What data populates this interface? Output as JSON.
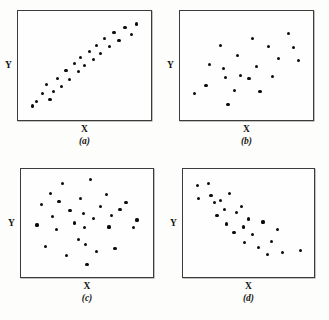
{
  "figure": {
    "background_color": "#fdfdfb",
    "frame_color": "#3b3b3b",
    "point_color": "#0b0b0b"
  },
  "labels": {
    "x": "X",
    "y": "Y",
    "caption_a": "(a)",
    "caption_b": "(b)",
    "caption_c": "(c)",
    "caption_d": "(d)"
  },
  "chart_data": [
    {
      "type": "scatter",
      "title": "(a)",
      "xlabel": "X",
      "ylabel": "Y",
      "xlim": [
        0,
        100
      ],
      "ylim": [
        0,
        100
      ],
      "grid": false,
      "legend": null,
      "annotation": "strong positive linear association",
      "points": [
        {
          "x": 8,
          "y": 9
        },
        {
          "x": 11,
          "y": 14
        },
        {
          "x": 16,
          "y": 22
        },
        {
          "x": 19,
          "y": 31
        },
        {
          "x": 22,
          "y": 16
        },
        {
          "x": 25,
          "y": 24
        },
        {
          "x": 28,
          "y": 37
        },
        {
          "x": 31,
          "y": 29
        },
        {
          "x": 35,
          "y": 45
        },
        {
          "x": 38,
          "y": 36
        },
        {
          "x": 42,
          "y": 52
        },
        {
          "x": 45,
          "y": 44
        },
        {
          "x": 47,
          "y": 58
        },
        {
          "x": 50,
          "y": 50
        },
        {
          "x": 54,
          "y": 64
        },
        {
          "x": 57,
          "y": 56
        },
        {
          "x": 60,
          "y": 70
        },
        {
          "x": 63,
          "y": 62
        },
        {
          "x": 66,
          "y": 77
        },
        {
          "x": 70,
          "y": 69
        },
        {
          "x": 74,
          "y": 83
        },
        {
          "x": 78,
          "y": 75
        },
        {
          "x": 83,
          "y": 88
        },
        {
          "x": 88,
          "y": 81
        },
        {
          "x": 92,
          "y": 92
        }
      ]
    },
    {
      "type": "scatter",
      "title": "(b)",
      "xlabel": "X",
      "ylabel": "Y",
      "xlim": [
        0,
        100
      ],
      "ylim": [
        0,
        100
      ],
      "grid": false,
      "legend": null,
      "annotation": "weak positive association with wide scatter",
      "points": [
        {
          "x": 8,
          "y": 22
        },
        {
          "x": 17,
          "y": 30
        },
        {
          "x": 20,
          "y": 51
        },
        {
          "x": 29,
          "y": 70
        },
        {
          "x": 31,
          "y": 47
        },
        {
          "x": 33,
          "y": 38
        },
        {
          "x": 35,
          "y": 11
        },
        {
          "x": 40,
          "y": 25
        },
        {
          "x": 43,
          "y": 60
        },
        {
          "x": 45,
          "y": 40
        },
        {
          "x": 52,
          "y": 37
        },
        {
          "x": 55,
          "y": 77
        },
        {
          "x": 58,
          "y": 49
        },
        {
          "x": 61,
          "y": 24
        },
        {
          "x": 68,
          "y": 69
        },
        {
          "x": 71,
          "y": 39
        },
        {
          "x": 76,
          "y": 57
        },
        {
          "x": 84,
          "y": 82
        },
        {
          "x": 88,
          "y": 68
        },
        {
          "x": 92,
          "y": 55
        }
      ]
    },
    {
      "type": "scatter",
      "title": "(c)",
      "xlabel": "X",
      "ylabel": "Y",
      "xlim": [
        0,
        100
      ],
      "ylim": [
        0,
        100
      ],
      "grid": false,
      "legend": null,
      "annotation": "no association, random cloud",
      "points": [
        {
          "x": 9,
          "y": 48
        },
        {
          "x": 13,
          "y": 69
        },
        {
          "x": 16,
          "y": 26
        },
        {
          "x": 20,
          "y": 80
        },
        {
          "x": 22,
          "y": 57
        },
        {
          "x": 25,
          "y": 43
        },
        {
          "x": 27,
          "y": 72
        },
        {
          "x": 30,
          "y": 90
        },
        {
          "x": 33,
          "y": 17
        },
        {
          "x": 36,
          "y": 63
        },
        {
          "x": 40,
          "y": 50
        },
        {
          "x": 43,
          "y": 33
        },
        {
          "x": 45,
          "y": 75
        },
        {
          "x": 47,
          "y": 60
        },
        {
          "x": 48,
          "y": 45
        },
        {
          "x": 49,
          "y": 28
        },
        {
          "x": 50,
          "y": 8
        },
        {
          "x": 53,
          "y": 94
        },
        {
          "x": 55,
          "y": 55
        },
        {
          "x": 58,
          "y": 21
        },
        {
          "x": 61,
          "y": 67
        },
        {
          "x": 66,
          "y": 79
        },
        {
          "x": 68,
          "y": 46
        },
        {
          "x": 70,
          "y": 58
        },
        {
          "x": 73,
          "y": 24
        },
        {
          "x": 77,
          "y": 64
        },
        {
          "x": 82,
          "y": 71
        },
        {
          "x": 88,
          "y": 45
        },
        {
          "x": 91,
          "y": 53
        }
      ]
    },
    {
      "type": "scatter",
      "title": "(d)",
      "xlabel": "X",
      "ylabel": "Y",
      "xlim": [
        0,
        100
      ],
      "ylim": [
        0,
        100
      ],
      "grid": false,
      "legend": null,
      "annotation": "negative association, decreasing trend",
      "points": [
        {
          "x": 8,
          "y": 88
        },
        {
          "x": 9,
          "y": 75
        },
        {
          "x": 17,
          "y": 90
        },
        {
          "x": 19,
          "y": 78
        },
        {
          "x": 22,
          "y": 71
        },
        {
          "x": 24,
          "y": 58
        },
        {
          "x": 27,
          "y": 73
        },
        {
          "x": 30,
          "y": 64
        },
        {
          "x": 32,
          "y": 49
        },
        {
          "x": 34,
          "y": 80
        },
        {
          "x": 38,
          "y": 40
        },
        {
          "x": 40,
          "y": 61
        },
        {
          "x": 44,
          "y": 67
        },
        {
          "x": 46,
          "y": 46
        },
        {
          "x": 47,
          "y": 30
        },
        {
          "x": 50,
          "y": 54
        },
        {
          "x": 53,
          "y": 38
        },
        {
          "x": 58,
          "y": 25
        },
        {
          "x": 62,
          "y": 51
        },
        {
          "x": 66,
          "y": 18
        },
        {
          "x": 69,
          "y": 31
        },
        {
          "x": 74,
          "y": 43
        },
        {
          "x": 78,
          "y": 20
        },
        {
          "x": 93,
          "y": 22
        }
      ]
    }
  ]
}
